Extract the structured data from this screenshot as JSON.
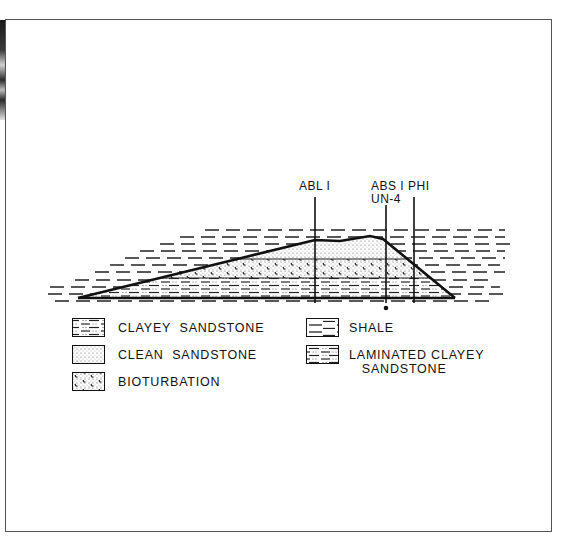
{
  "diagram": {
    "type": "geological-cross-section",
    "wells": [
      {
        "name": "ABL1",
        "label": "ABL I",
        "x": 315
      },
      {
        "name": "ABS1",
        "label": "ABS I",
        "sublabel": "UN-4",
        "x": 386
      },
      {
        "name": "PHI1",
        "label": "PHI",
        "x": 414
      }
    ],
    "units_bottom_to_top": [
      "Clayey sandstone / laminated base",
      "Bioturbation",
      "Clean sandstone"
    ],
    "surrounding": "Shale"
  },
  "legend": {
    "items": [
      {
        "key": "clayey-sandstone",
        "label": "CLAYEY  SANDSTONE"
      },
      {
        "key": "clean-sandstone",
        "label": "CLEAN  SANDSTONE"
      },
      {
        "key": "bioturbation",
        "label": "BIOTURBATION"
      },
      {
        "key": "shale",
        "label": "SHALE"
      },
      {
        "key": "laminated-clayey-sandstone",
        "label": "LAMINATED CLAYEY\n   SANDSTONE"
      }
    ]
  },
  "colors": {
    "ink": "#111111",
    "frame": "#555555",
    "paper": "#ffffff"
  }
}
